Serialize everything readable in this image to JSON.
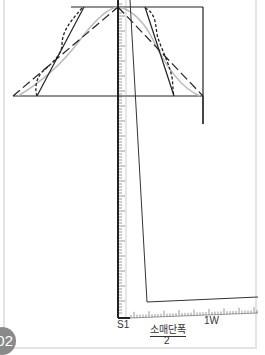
{
  "figure": {
    "badge_number": "02",
    "labels": {
      "start_point": "S1",
      "end_point": "1W",
      "fraction_numerator": "소매단폭",
      "fraction_denominator": "2"
    },
    "ruler_vertical_ticks": [
      "50",
      "45",
      "40",
      "35",
      "30",
      "25",
      "20",
      "15",
      "10",
      "5"
    ],
    "ruler_horizontal_ticks": [
      "5",
      "10",
      "15",
      "20"
    ]
  }
}
